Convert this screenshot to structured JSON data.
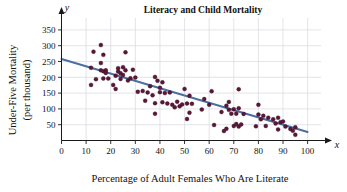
{
  "chart_data": {
    "type": "scatter",
    "title": "Literacy and Child Mortality",
    "xlabel": "Percentage of Adult Females Who Are Literate",
    "ylabel_line1": "Under-Five Mortality",
    "ylabel_line2": "(per thousand)",
    "x_axis_variable": "x",
    "y_axis_variable": "y",
    "xlim": [
      0,
      103
    ],
    "ylim": [
      0,
      375
    ],
    "xticks": [
      0,
      10,
      20,
      30,
      40,
      50,
      60,
      70,
      80,
      90,
      100
    ],
    "ytick_labels": [
      50,
      100,
      150,
      200,
      250,
      300,
      350
    ],
    "grid": true,
    "legend": "none",
    "point_color": "#5e1638",
    "line_color": "#4a6fa0",
    "trend_line": {
      "name": "least-squares regression line",
      "x_start": 0,
      "y_start": 258,
      "x_end": 100,
      "y_end": 27
    },
    "points": [
      [
        12,
        230
      ],
      [
        12,
        176
      ],
      [
        13,
        281
      ],
      [
        14,
        194
      ],
      [
        16,
        302
      ],
      [
        16,
        222
      ],
      [
        16,
        245
      ],
      [
        17,
        271
      ],
      [
        17,
        219
      ],
      [
        17,
        196
      ],
      [
        18,
        222
      ],
      [
        18,
        214
      ],
      [
        19,
        196
      ],
      [
        21,
        176
      ],
      [
        22,
        163
      ],
      [
        22,
        205
      ],
      [
        23,
        229
      ],
      [
        23,
        218
      ],
      [
        24,
        213
      ],
      [
        24,
        195
      ],
      [
        25,
        232
      ],
      [
        25,
        207
      ],
      [
        26,
        279
      ],
      [
        26,
        222
      ],
      [
        27,
        190
      ],
      [
        28,
        197
      ],
      [
        29,
        224
      ],
      [
        30,
        199
      ],
      [
        31,
        154
      ],
      [
        33,
        157
      ],
      [
        34,
        126
      ],
      [
        35,
        152
      ],
      [
        36,
        172
      ],
      [
        37,
        143
      ],
      [
        38,
        201
      ],
      [
        38,
        85
      ],
      [
        38,
        118
      ],
      [
        39,
        189
      ],
      [
        40,
        167
      ],
      [
        40,
        153
      ],
      [
        41,
        184
      ],
      [
        41,
        121
      ],
      [
        42,
        150
      ],
      [
        43,
        117
      ],
      [
        44,
        152
      ],
      [
        45,
        113
      ],
      [
        46,
        105
      ],
      [
        47,
        123
      ],
      [
        48,
        108
      ],
      [
        49,
        114
      ],
      [
        50,
        163
      ],
      [
        51,
        117
      ],
      [
        51,
        68
      ],
      [
        52,
        142
      ],
      [
        52,
        88
      ],
      [
        53,
        116
      ],
      [
        57,
        98
      ],
      [
        58,
        131
      ],
      [
        60,
        113
      ],
      [
        61,
        156
      ],
      [
        62,
        49
      ],
      [
        65,
        90
      ],
      [
        66,
        30
      ],
      [
        67,
        37
      ],
      [
        67,
        110
      ],
      [
        68,
        122
      ],
      [
        68,
        97
      ],
      [
        69,
        85
      ],
      [
        70,
        46
      ],
      [
        70,
        99
      ],
      [
        71,
        52
      ],
      [
        71,
        85
      ],
      [
        72,
        162
      ],
      [
        72,
        102
      ],
      [
        72,
        44
      ],
      [
        73,
        51
      ],
      [
        74,
        84
      ],
      [
        79,
        45
      ],
      [
        80,
        113
      ],
      [
        80,
        82
      ],
      [
        81,
        67
      ],
      [
        82,
        78
      ],
      [
        83,
        46
      ],
      [
        84,
        72
      ],
      [
        86,
        67
      ],
      [
        87,
        54
      ],
      [
        88,
        35
      ],
      [
        88,
        72
      ],
      [
        89,
        58
      ],
      [
        90,
        60
      ],
      [
        91,
        44
      ],
      [
        93,
        36
      ],
      [
        94,
        31
      ],
      [
        95,
        18
      ],
      [
        95,
        42
      ]
    ]
  }
}
